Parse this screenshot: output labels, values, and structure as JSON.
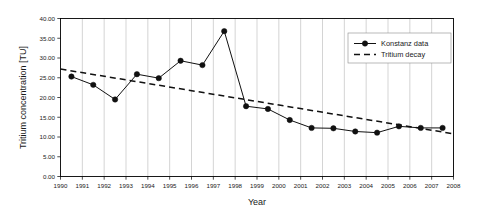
{
  "chart_data": {
    "type": "line",
    "title": "",
    "xlabel": "Year",
    "ylabel": "Tritium concentration [TU]",
    "xlim": [
      1990,
      2008
    ],
    "ylim": [
      0,
      40
    ],
    "xticks": [
      1990,
      1991,
      1992,
      1993,
      1994,
      1995,
      1996,
      1997,
      1998,
      1999,
      2000,
      2001,
      2002,
      2003,
      2004,
      2005,
      2006,
      2007,
      2008
    ],
    "xtick_labels": [
      "1990",
      "1991",
      "1992",
      "1993",
      "1994",
      "1995",
      "1996",
      "1997",
      "1998",
      "1999",
      "2000",
      "2001",
      "2002",
      "2003",
      "2004",
      "2005",
      "2006",
      "2007",
      "2008"
    ],
    "yticks": [
      0,
      5,
      10,
      15,
      20,
      25,
      30,
      35,
      40
    ],
    "ytick_labels": [
      "0.00",
      "5.00",
      "10.00",
      "15.00",
      "20.00",
      "25.00",
      "30.00",
      "35.00",
      "40.00"
    ],
    "grid": "vertical",
    "legend_position": "upper-right",
    "series": [
      {
        "name": "Konstanz data",
        "style": "solid-with-markers",
        "marker": "filled-circle",
        "color": "#111111",
        "x": [
          1990.5,
          1991.5,
          1992.5,
          1993.5,
          1994.5,
          1995.5,
          1996.5,
          1997.5,
          1998.5,
          1999.5,
          2000.5,
          2001.5,
          2002.5,
          2003.5,
          2004.5,
          2005.5,
          2006.5,
          2007.5
        ],
        "values": [
          25.3,
          23.2,
          19.5,
          25.9,
          24.9,
          29.3,
          28.2,
          36.8,
          17.8,
          17.1,
          14.3,
          12.3,
          12.2,
          11.4,
          11.1,
          12.7,
          12.3,
          12.3
        ]
      },
      {
        "name": "Tritium decay",
        "style": "dashed",
        "marker": "none",
        "color": "#111111",
        "x": [
          1990.0,
          2008.0
        ],
        "values": [
          27.2,
          10.8
        ]
      }
    ]
  },
  "legend": {
    "entries": [
      {
        "label": "Konstanz data"
      },
      {
        "label": "Tritium decay"
      }
    ]
  },
  "axes": {
    "x_title": "Year",
    "y_title": "Tritium concentration [TU]"
  }
}
